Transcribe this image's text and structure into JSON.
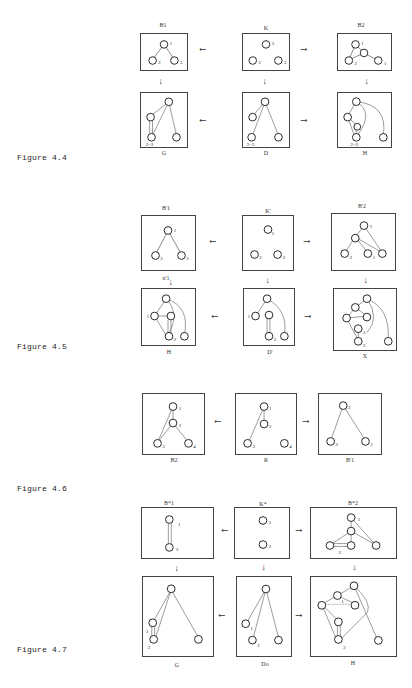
{
  "figures": [
    {
      "label": "Figure 4.4",
      "top_row": [
        "B1",
        "K",
        "B2"
      ],
      "bottom_row": [
        "G",
        "D",
        "H"
      ],
      "annotations": [
        "2=3"
      ]
    },
    {
      "label": "Figure 4.5",
      "top_row": [
        "B'1",
        "K'",
        "B'2"
      ],
      "bottom_row": [
        "H",
        "D'",
        "X"
      ],
      "annotations": [
        "n'1"
      ]
    },
    {
      "label": "Figure 4.6",
      "row": [
        "B2",
        "R",
        "B'1"
      ]
    },
    {
      "label": "Figure 4.7",
      "top_row": [
        "B*1",
        "K*",
        "B*2"
      ],
      "bottom_row": [
        "G",
        "Do",
        "H"
      ]
    }
  ],
  "captions": {
    "f44_b1": "B1",
    "f44_k": "K",
    "f44_b2": "B2",
    "f44_g": "G",
    "f44_d": "D",
    "f44_h": "H",
    "f45_b1": "B'1",
    "f45_k": "K'",
    "f45_b2": "B'2",
    "f45_h": "H",
    "f45_d": "D'",
    "f45_x": "X",
    "f45_n": "n'1",
    "f46_b2": "B2",
    "f46_r": "R",
    "f46_b1": "B'1",
    "f47_b1": "B*1",
    "f47_k": "K*",
    "f47_b2": "B*2",
    "f47_g": "G",
    "f47_d": "Do",
    "f47_h": "H"
  },
  "arrows": {
    "left": "⟵",
    "right": "⟶",
    "down": "↓"
  }
}
